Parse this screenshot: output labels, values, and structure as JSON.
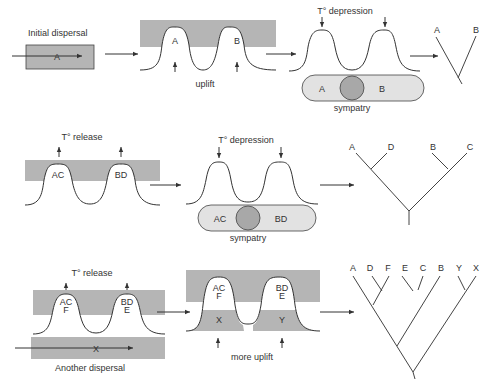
{
  "colors": {
    "shade": "#b5b5b5",
    "light_shade": "#e2e2e2",
    "circle": "#a8a8a8",
    "line": "#333333"
  },
  "row1": {
    "dispersal_label": "Initial dispersal",
    "dispersal_taxon": "A",
    "mountains": [
      "A",
      "B"
    ],
    "uplift_label": "uplift",
    "depression_label": "T° depression",
    "sympatry_taxa": [
      "A",
      "B"
    ],
    "sympatry_label": "sympatry",
    "tree_tips": [
      "A",
      "B"
    ]
  },
  "row2": {
    "release_label": "T° release",
    "mountains": [
      "AC",
      "BD"
    ],
    "depression_label": "T° depression",
    "sympatry_taxa": [
      "AC",
      "BD"
    ],
    "sympatry_label": "sympatry",
    "tree_tips": [
      "A",
      "D",
      "B",
      "C"
    ]
  },
  "row3": {
    "release_label": "T° release",
    "mountains": [
      {
        "line1": "AC",
        "line2": "F"
      },
      {
        "line1": "BD",
        "line2": "E"
      }
    ],
    "dispersal_taxon": "X",
    "dispersal_label": "Another dispersal",
    "uplift_mountains": [
      {
        "line1": "AC",
        "line2": "F",
        "lower": "X"
      },
      {
        "line1": "BD",
        "line2": "E",
        "lower": "Y"
      }
    ],
    "more_uplift_label": "more uplift",
    "tree_tips": [
      "A",
      "D",
      "F",
      "E",
      "C",
      "B",
      "Y",
      "X"
    ]
  }
}
